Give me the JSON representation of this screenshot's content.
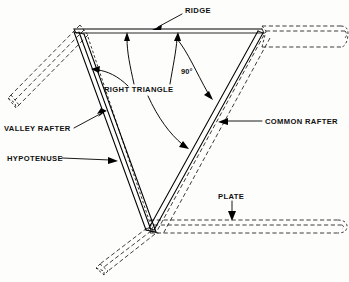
{
  "diagram": {
    "type": "technical-line-drawing",
    "background_color": "#fdfdfc",
    "line_color": "#000000",
    "labels": {
      "ridge": "RIDGE",
      "right_triangle": "RIGHT TRIANGLE",
      "angle": "90°",
      "common_rafter": "COMMON RAFTER",
      "valley_rafter": "VALLEY RAFTER",
      "hypotenuse": "HYPOTENUSE",
      "plate": "PLATE"
    },
    "members": [
      {
        "name": "ridge",
        "label": "RIDGE",
        "style": "solid",
        "description": "horizontal ridge beam across the top"
      },
      {
        "name": "ridge-extension",
        "label": "RIDGE",
        "style": "hidden",
        "description": "ridge beam continuing to the right in hidden line"
      },
      {
        "name": "valley-rafter",
        "label": "VALLEY RAFTER",
        "style": "solid",
        "description": "sloping member from ridge junction down to plate junction"
      },
      {
        "name": "common-rafter",
        "label": "COMMON RAFTER",
        "style": "solid",
        "description": "sloping member from ridge right end down to plate junction"
      },
      {
        "name": "plate",
        "label": "PLATE",
        "style": "hidden",
        "description": "horizontal wall plate running right from the bottom junction"
      },
      {
        "name": "plate-left",
        "label": "PLATE",
        "style": "hidden",
        "description": "wall plate running down-left from the bottom junction"
      },
      {
        "name": "upper-left-plate",
        "label": "PLATE",
        "style": "hidden",
        "description": "wall plate running down-left from the ridge junction"
      }
    ],
    "annotations": [
      {
        "name": "ridge-leader",
        "text": "RIDGE",
        "points_to": "ridge beam"
      },
      {
        "name": "angle-annotation",
        "text": "90°",
        "points_to": "common rafter, ridge intersection"
      },
      {
        "name": "right-triangle-leaders",
        "text": "RIGHT TRIANGLE",
        "points_to": "ridge, valley rafter, common rafter"
      },
      {
        "name": "common-rafter-leader",
        "text": "COMMON RAFTER",
        "points_to": "common rafter"
      },
      {
        "name": "valley-rafter-leader",
        "text": "VALLEY RAFTER",
        "points_to": "valley rafter"
      },
      {
        "name": "hypotenuse-leader",
        "text": "HYPOTENUSE",
        "points_to": "valley rafter"
      },
      {
        "name": "plate-leader",
        "text": "PLATE",
        "points_to": "plate"
      }
    ]
  }
}
